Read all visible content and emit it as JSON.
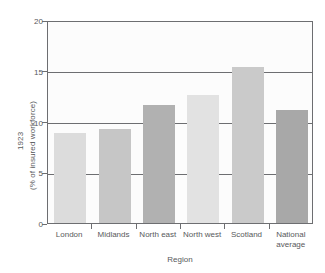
{
  "chart_data": {
    "type": "bar",
    "title": "",
    "subtitle": "",
    "xlabel": "Region",
    "ylabel": "1923 (% of insured workforce)",
    "ylabel_lines": [
      "1923",
      "(% of insured workforce)"
    ],
    "categories": [
      "London",
      "Midlands",
      "North east",
      "North west",
      "Scotland",
      "National average"
    ],
    "values": [
      8.9,
      9.3,
      11.6,
      12.6,
      15.4,
      11.1
    ],
    "bar_colors": [
      "#dcdcdc",
      "#c6c6c6",
      "#b1b1b1",
      "#e2e2e2",
      "#cacaca",
      "#a8a8a8"
    ],
    "ylim": [
      0,
      20
    ],
    "yticks": [
      0,
      5,
      10,
      15,
      20
    ],
    "ytick_labels": [
      "0",
      "5",
      "10",
      "15",
      "20"
    ],
    "grid": true,
    "grid_axis": "y",
    "legend": null,
    "legend_position": "none",
    "annotations": []
  },
  "style": {
    "axis_color": "#6d6e71",
    "text_color": "#58595b",
    "plot_background": "#fcfcfc",
    "page_background": "#ffffff"
  }
}
